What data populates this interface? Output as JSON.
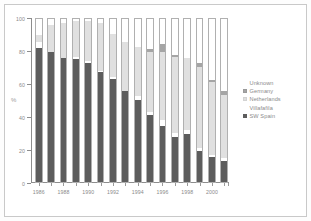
{
  "chart_data": {
    "type": "bar",
    "subtype": "stacked-100-percent",
    "title": "",
    "xlabel": "",
    "ylabel": "%",
    "ylim": [
      0,
      100
    ],
    "yticks": [
      0,
      20,
      40,
      60,
      80,
      100
    ],
    "grid": false,
    "legend_position": "right",
    "categories": [
      "1986",
      "1987",
      "1988",
      "1989",
      "1990",
      "1991",
      "1992",
      "1993",
      "1994",
      "1995",
      "1996",
      "1997",
      "1998",
      "1999",
      "2000",
      "2001"
    ],
    "tick_labels": [
      "1986",
      "1988",
      "1990",
      "1992",
      "1994",
      "1996",
      "1998",
      "2000"
    ],
    "series": [
      {
        "name": "SW Spain",
        "color": "#5d5d5d",
        "values": [
          82,
          79.5,
          76,
          75,
          73,
          67,
          63,
          56,
          50.5,
          41.5,
          34.5,
          28,
          29.5,
          19.5,
          16,
          13.5
        ]
      },
      {
        "name": "Villafafila",
        "color": "#ffffff",
        "values": [
          3.5,
          0,
          0,
          1.5,
          1,
          1,
          1.5,
          0,
          2,
          1.5,
          3.5,
          2.5,
          2.5,
          1.5,
          1,
          1.5
        ]
      },
      {
        "name": "Netherlands",
        "color": "#e0e0e0",
        "values": [
          4.5,
          16.5,
          21,
          21.5,
          24,
          29,
          26,
          29.5,
          30,
          36.5,
          41.5,
          46,
          44,
          49.5,
          44.5,
          38.5
        ]
      },
      {
        "name": "Germany",
        "color": "#a5a5a5",
        "values": [
          0,
          0,
          0,
          0,
          0,
          0,
          0,
          0,
          0,
          1.5,
          4.5,
          1,
          0,
          2.5,
          1,
          2.5
        ]
      },
      {
        "name": "Unknown",
        "color": "#ffffff",
        "values": [
          10,
          4,
          3,
          2,
          2,
          3,
          9.5,
          14.5,
          17.5,
          19,
          16,
          22.5,
          24,
          27,
          37.5,
          44
        ]
      }
    ]
  },
  "legend": {
    "items": [
      {
        "label": "Unknown",
        "swatch": "sw-unknown"
      },
      {
        "label": "Germany",
        "swatch": "sw-germany"
      },
      {
        "label": "Netherlands",
        "swatch": "sw-netherlands"
      },
      {
        "label": "Villafafila",
        "swatch": "sw-villafafila"
      },
      {
        "label": "SW Spain",
        "swatch": "sw-sw-spain"
      }
    ]
  },
  "axes": {
    "y_title": "%"
  }
}
